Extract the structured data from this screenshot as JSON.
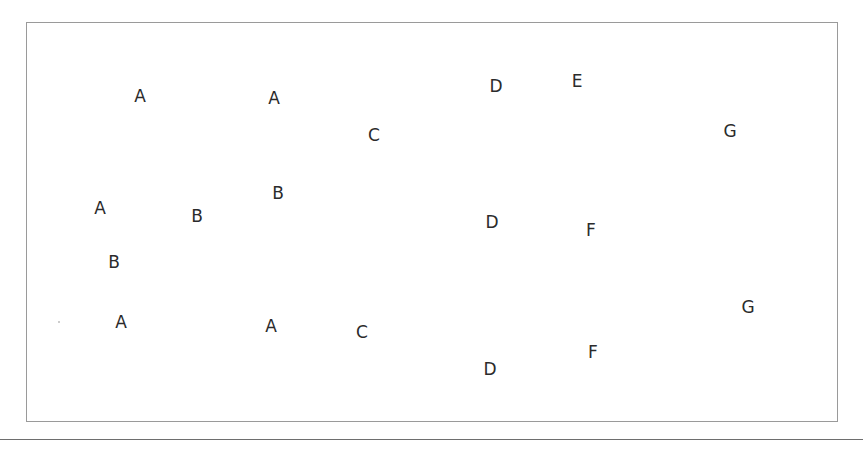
{
  "diagram": {
    "type": "scattered letter labels in a bordered box",
    "frame": {
      "left": 26,
      "top": 22,
      "right": 838,
      "bottom": 422,
      "border_color": "#9a9a9a"
    },
    "baseline_y": 439,
    "text_color": "#2b2b2b",
    "labels": [
      {
        "text": "A",
        "x": 140,
        "y": 96
      },
      {
        "text": "A",
        "x": 274,
        "y": 98
      },
      {
        "text": "C",
        "x": 374,
        "y": 135
      },
      {
        "text": "D",
        "x": 496,
        "y": 86
      },
      {
        "text": "E",
        "x": 577,
        "y": 81
      },
      {
        "text": "G",
        "x": 730,
        "y": 131
      },
      {
        "text": "A",
        "x": 100,
        "y": 208
      },
      {
        "text": "B",
        "x": 197,
        "y": 216
      },
      {
        "text": "B",
        "x": 278,
        "y": 193
      },
      {
        "text": "D",
        "x": 492,
        "y": 222
      },
      {
        "text": "F",
        "x": 591,
        "y": 230
      },
      {
        "text": "B",
        "x": 114,
        "y": 262
      },
      {
        "text": "A",
        "x": 121,
        "y": 322
      },
      {
        "text": "A",
        "x": 271,
        "y": 326
      },
      {
        "text": "C",
        "x": 362,
        "y": 332
      },
      {
        "text": "G",
        "x": 748,
        "y": 307
      },
      {
        "text": "F",
        "x": 593,
        "y": 352
      },
      {
        "text": "D",
        "x": 490,
        "y": 369
      }
    ]
  }
}
